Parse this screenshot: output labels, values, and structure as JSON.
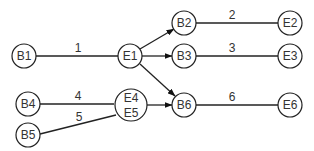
{
  "nodes": {
    "B1": {
      "label": "B1"
    },
    "E1": {
      "label": "E1"
    },
    "B2": {
      "label": "B2"
    },
    "E2": {
      "label": "E2"
    },
    "B3": {
      "label": "B3"
    },
    "E3": {
      "label": "E3"
    },
    "B4": {
      "label": "B4"
    },
    "B5": {
      "label": "B5"
    },
    "E45": {
      "label_top": "E4",
      "label_bottom": "E5"
    },
    "B6": {
      "label": "B6"
    },
    "E6": {
      "label": "E6"
    }
  },
  "edges": {
    "e1": {
      "label": "1",
      "from": "B1",
      "to": "E1"
    },
    "e2": {
      "label": "2",
      "from": "B2",
      "to": "E2"
    },
    "e3": {
      "label": "3",
      "from": "B3",
      "to": "E3"
    },
    "e4": {
      "label": "4",
      "from": "B4",
      "to": "E4"
    },
    "e5": {
      "label": "5",
      "from": "B5",
      "to": "E5"
    },
    "e6": {
      "label": "6",
      "from": "B6",
      "to": "E6"
    }
  },
  "arrows": [
    {
      "from": "E1",
      "to": "B2"
    },
    {
      "from": "E1",
      "to": "B3"
    },
    {
      "from": "E1",
      "to": "B6"
    },
    {
      "from": "E4/E5",
      "to": "B6"
    }
  ]
}
